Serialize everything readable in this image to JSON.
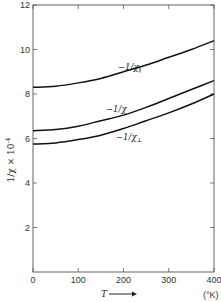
{
  "chart_data": {
    "type": "line",
    "title": "",
    "xlabel": "T",
    "xunit": "(°K)",
    "ylabel": "1/χ × 10⁻⁴",
    "xlim": [
      0,
      400
    ],
    "ylim": [
      0,
      12
    ],
    "xticks": [
      0,
      100,
      200,
      300,
      400
    ],
    "yticks": [
      2,
      4,
      6,
      8,
      10,
      12
    ],
    "xtick_labels": [
      "0",
      "100",
      "200",
      "300",
      "400"
    ],
    "ytick_labels": [
      "2",
      "4",
      "6",
      "8",
      "10",
      "12"
    ],
    "grid": false,
    "legend": "inline labels on curves",
    "x": [
      0,
      50,
      100,
      150,
      200,
      250,
      300,
      350,
      400
    ],
    "series": [
      {
        "name": "-1/χ∥",
        "values": [
          8.3,
          8.35,
          8.5,
          8.7,
          9.0,
          9.3,
          9.65,
          10.0,
          10.4
        ]
      },
      {
        "name": "-1/χ",
        "values": [
          6.35,
          6.4,
          6.55,
          6.8,
          7.05,
          7.4,
          7.8,
          8.2,
          8.6
        ]
      },
      {
        "name": "-1/χ⊥",
        "values": [
          5.75,
          5.8,
          5.95,
          6.15,
          6.45,
          6.8,
          7.15,
          7.55,
          8.0
        ]
      }
    ]
  },
  "labels": {
    "y_axis": "1/χ × 10",
    "y_axis_exp": "-4",
    "x_axis": "T",
    "x_arrow": "⟶",
    "x_unit": "(°K)",
    "curve_par": "−1/χ",
    "curve_par_sub": "∥",
    "curve_avg": "−1/χ",
    "curve_perp": "−1/χ",
    "curve_perp_sub": "⊥"
  }
}
